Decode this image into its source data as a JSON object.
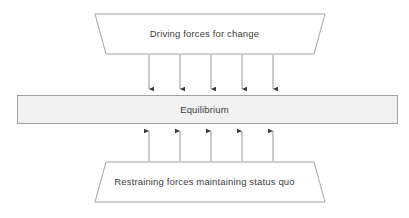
{
  "diagram": {
    "type": "force-field-analysis",
    "title_text": "",
    "colors": {
      "stroke": "#9a9a9a",
      "bar_fill": "#f1f1f1",
      "bar_stroke": "#9a9a9a",
      "trapezoid_fill": "#ffffff",
      "arrow": "#8c8c8c",
      "arrow_head": "#3a3a3a",
      "text": "#404040",
      "background": "#ffffff"
    },
    "top_shape": {
      "name": "driving-forces-trapezoid",
      "label": "Driving forces for change",
      "shape": "trapezoid",
      "points": "95,14 325,14 314,54 106,54"
    },
    "middle_shape": {
      "name": "equilibrium-bar",
      "label": "Equilibrium",
      "shape": "rectangle",
      "x": 17,
      "y": 95,
      "width": 381,
      "height": 29
    },
    "bottom_shape": {
      "name": "restraining-forces-trapezoid",
      "label": "Restraining forces maintaining status quo",
      "shape": "trapezoid",
      "points": "106,162 314,162 325,202 95,202"
    },
    "down_arrows": {
      "name": "driving-force-arrows",
      "count": 5,
      "direction": "down",
      "x_positions": [
        149,
        180,
        211,
        242,
        273
      ],
      "y_start": 54,
      "y_end": 94
    },
    "up_arrows": {
      "name": "restraining-force-arrows",
      "count": 5,
      "direction": "up",
      "x_positions": [
        149,
        180,
        211,
        242,
        273
      ],
      "y_start": 162,
      "y_end": 126
    }
  }
}
